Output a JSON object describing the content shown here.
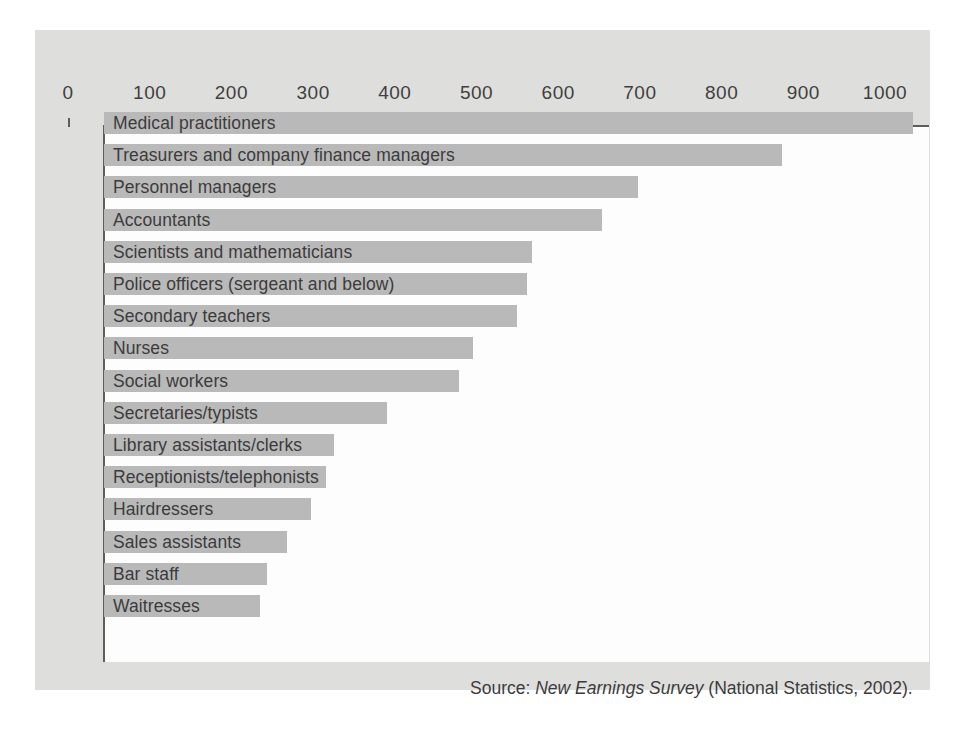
{
  "chart_data": {
    "type": "bar",
    "orientation": "horizontal",
    "title": "",
    "xlabel": "",
    "ylabel": "",
    "xlim": [
      0,
      1000
    ],
    "grid": false,
    "legend": null,
    "tick_labels": [
      "0",
      "100",
      "200",
      "300",
      "400",
      "500",
      "600",
      "700",
      "800",
      "900",
      "1000"
    ],
    "tick_values": [
      0,
      100,
      200,
      300,
      400,
      500,
      600,
      700,
      800,
      900,
      1000
    ],
    "categories": [
      "Medical practitioners",
      "Treasurers and company finance managers",
      "Personnel managers",
      "Accountants",
      "Scientists and mathematicians",
      "Police officers (sergeant and below)",
      "Secondary teachers",
      "Nurses",
      "Social workers",
      "Secretaries/typists",
      "Library assistants/clerks",
      "Receptionists/telephonists",
      "Hairdressers",
      "Sales assistants",
      "Bar staff",
      "Waitresses"
    ],
    "values": [
      990,
      830,
      653,
      610,
      524,
      518,
      506,
      452,
      434,
      346,
      281,
      272,
      253,
      224,
      199,
      191
    ],
    "bar_color": "#b9b9b9",
    "axis_color": "#5d5d5d"
  },
  "source": {
    "prefix": "Source: ",
    "title": "New Earnings Survey",
    "suffix": " (National Statistics, 2002)."
  }
}
